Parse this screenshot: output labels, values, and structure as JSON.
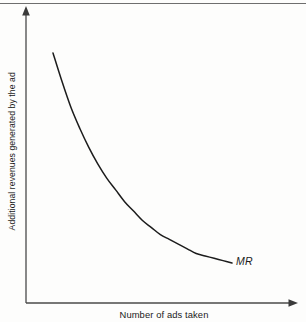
{
  "chart_data": {
    "type": "line",
    "title": "",
    "subtitle": "",
    "xlabel": "Number of ads taken",
    "ylabel": "Additional revenues generated by the ad",
    "xlim": [
      0,
      100
    ],
    "ylim": [
      0,
      100
    ],
    "grid": false,
    "legend_position": "inline-end-of-curve",
    "axis_ticks": {
      "x_tick_labels": [],
      "y_tick_labels": []
    },
    "axes_style": {
      "x_axis_arrow": true,
      "y_axis_arrow": true,
      "axis_color": "#4a4a4a",
      "curve_color": "#1c1c1c"
    },
    "series": [
      {
        "name": "MR",
        "label": "MR",
        "label_style": "italic",
        "description": "Marginal revenue: additional revenue generated by each successive ad, declining convexly toward zero",
        "x": [
          0,
          5,
          10,
          15,
          20,
          25,
          30,
          35,
          40,
          45,
          50,
          55,
          60,
          65,
          70,
          75,
          80,
          85,
          90,
          95,
          100
        ],
        "y": [
          100,
          88,
          77,
          68,
          60,
          53,
          47,
          42,
          37,
          33,
          29,
          26,
          23,
          21,
          19,
          17,
          15,
          14,
          13,
          12,
          11
        ]
      }
    ],
    "annotations": [
      {
        "text": "MR",
        "x": 100,
        "y": 11,
        "placement": "right-of-curve-end"
      }
    ]
  },
  "figure": {
    "background_color": "#fdfdfc",
    "top_rule_color": "#6e6e6e",
    "caption": ""
  }
}
